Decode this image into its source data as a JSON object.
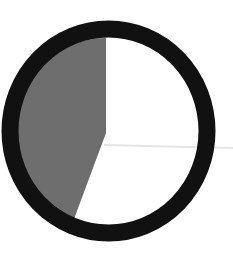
{
  "figure": {
    "kind": "pie-indicator",
    "filled_fraction_percent": 44,
    "filled_start_angle_deg": 201,
    "filled_end_angle_deg": 360
  },
  "colors": {
    "background": "#ffffff",
    "ring": "#111111",
    "filled_sector": "#6e6e6e",
    "empty_sector": "#ffffff",
    "guide_line": "#e4e4e4"
  }
}
